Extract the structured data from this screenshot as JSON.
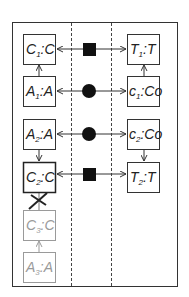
{
  "diagram": {
    "frame_color": "#333333",
    "ghost_color": "#9a9a9a",
    "left_boxes": [
      {
        "id": "C1",
        "sym": "C",
        "sub": "1",
        "type": "C",
        "y": 34,
        "ghost": false
      },
      {
        "id": "A1",
        "sym": "A",
        "sub": "1",
        "type": "A",
        "y": 76,
        "ghost": false
      },
      {
        "id": "A2",
        "sym": "A",
        "sub": "2",
        "type": "A",
        "y": 119,
        "ghost": false
      },
      {
        "id": "C2",
        "sym": "C",
        "sub": "2",
        "type": "C",
        "y": 162,
        "ghost": false
      },
      {
        "id": "C3",
        "sym": "C",
        "sub": "3",
        "type": "C",
        "y": 210,
        "ghost": true
      },
      {
        "id": "A3",
        "sym": "A",
        "sub": "3",
        "type": "A",
        "y": 252,
        "ghost": true
      }
    ],
    "right_boxes": [
      {
        "id": "T1",
        "sym": "T",
        "sub": "1",
        "type": "T",
        "y": 34
      },
      {
        "id": "c1",
        "sym": "c",
        "sub": "1",
        "type": "Co",
        "y": 76
      },
      {
        "id": "c2",
        "sym": "c",
        "sub": "2",
        "type": "Co",
        "y": 119
      },
      {
        "id": "T2",
        "sym": "T",
        "sub": "2",
        "type": "T",
        "y": 162
      }
    ],
    "connectors": [
      {
        "row": 0,
        "shape": "square",
        "left": "C1",
        "right": "T1"
      },
      {
        "row": 1,
        "shape": "circle",
        "left": "A1",
        "right": "c1"
      },
      {
        "row": 2,
        "shape": "circle",
        "left": "A2",
        "right": "c2"
      },
      {
        "row": 3,
        "shape": "square",
        "left": "C2",
        "right": "T2"
      }
    ],
    "vertical_arrows": [
      {
        "from": "A1",
        "to": "C1",
        "direction": "up"
      },
      {
        "from": "c1",
        "to": "T1",
        "direction": "up"
      },
      {
        "from": "A2",
        "to": "C2",
        "direction": "down"
      },
      {
        "from": "c2",
        "to": "T2",
        "direction": "down"
      },
      {
        "from": "C3",
        "to": "C2",
        "direction": "up",
        "crossed": true
      },
      {
        "from": "A3",
        "to": "C3",
        "direction": "up",
        "ghost": true
      }
    ]
  }
}
